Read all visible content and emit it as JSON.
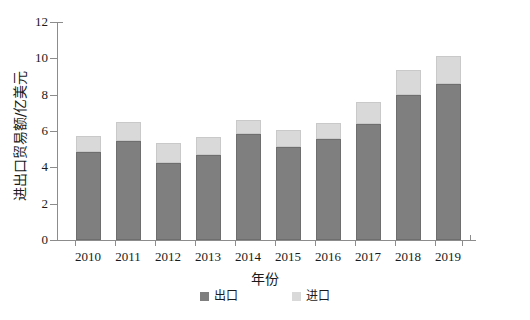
{
  "chart_data": {
    "type": "bar",
    "stacked": true,
    "title": "",
    "xlabel": "年份",
    "ylabel": "进出口贸易额/亿美元",
    "categories": [
      "2010",
      "2011",
      "2012",
      "2013",
      "2014",
      "2015",
      "2016",
      "2017",
      "2018",
      "2019"
    ],
    "series": [
      {
        "name": "出口",
        "color": "#7f7f7f",
        "values": [
          4.85,
          5.45,
          4.25,
          4.7,
          5.85,
          5.1,
          5.55,
          6.4,
          8.0,
          8.6
        ]
      },
      {
        "name": "进口",
        "color": "#d9d9d9",
        "values": [
          0.9,
          1.05,
          1.1,
          0.95,
          0.75,
          0.95,
          0.9,
          1.2,
          1.35,
          1.55
        ]
      }
    ],
    "totals": [
      5.75,
      6.5,
      5.35,
      5.65,
      6.6,
      6.05,
      6.45,
      7.6,
      9.35,
      10.15
    ],
    "yticks": [
      "0",
      "2",
      "4",
      "6",
      "8",
      "10",
      "12"
    ],
    "ylim": [
      0,
      12
    ],
    "grid": false,
    "legend_position": "bottom"
  },
  "legend": {
    "items": [
      {
        "label": "出口",
        "swatch": "export"
      },
      {
        "label": "进口",
        "swatch": "import"
      }
    ]
  },
  "axes": {
    "x_title": "年份",
    "y_title": "进出口贸易额/亿美元"
  }
}
